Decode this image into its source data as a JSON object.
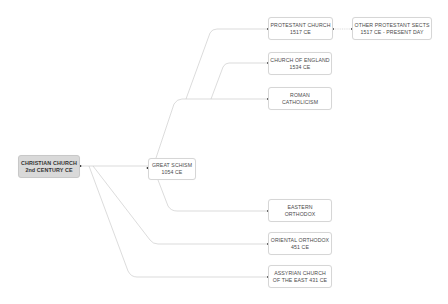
{
  "diagram": {
    "type": "tree",
    "root": {
      "line1": "CHRISTIAN CHURCH",
      "line2": "2nd CENTURY CE"
    },
    "nodes": {
      "great_schism": {
        "line1": "GREAT SCHISM",
        "line2": "1054 CE"
      },
      "protestant": {
        "line1": "PROTESTANT CHURCH",
        "line2": "1517 CE"
      },
      "other_protestant": {
        "line1": "OTHER PROTESTANT SECTS",
        "line2": "1517 CE - PRESENT DAY"
      },
      "church_of_england": {
        "line1": "CHURCH OF ENGLAND",
        "line2": "1534 CE"
      },
      "roman_catholicism": {
        "line1": "ROMAN",
        "line2": "CATHOLICISM"
      },
      "eastern_orthodox": {
        "line1": "EASTERN",
        "line2": "ORTHODOX"
      },
      "oriental_orthodox": {
        "line1": "ORIENTAL ORTHODOX",
        "line2": "451 CE"
      },
      "assyrian": {
        "line1": "ASSYRIAN CHURCH",
        "line2": "OF THE EAST 431 CE"
      }
    },
    "edges": [
      [
        "root",
        "great_schism"
      ],
      [
        "root",
        "oriental_orthodox"
      ],
      [
        "root",
        "assyrian"
      ],
      [
        "great_schism",
        "protestant"
      ],
      [
        "great_schism",
        "church_of_england"
      ],
      [
        "great_schism",
        "roman_catholicism"
      ],
      [
        "great_schism",
        "eastern_orthodox"
      ],
      [
        "protestant",
        "other_protestant"
      ]
    ],
    "colors": {
      "root_fill": "#d9d9d9",
      "node_border": "#d6d6d6",
      "line": "#bdbdbd",
      "text": "#4a4a4a"
    }
  }
}
